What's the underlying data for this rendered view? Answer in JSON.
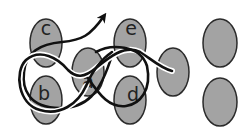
{
  "diagram": {
    "node_fill": "#a3a3a3",
    "node_stroke": "#2b2b2b",
    "path_color": "#111111",
    "nodes": [
      {
        "id": "c",
        "label": "c",
        "cx": 46,
        "cy": 43
      },
      {
        "id": "b",
        "label": "b",
        "cx": 46,
        "cy": 100
      },
      {
        "id": "a",
        "label": "a",
        "cx": 88,
        "cy": 72
      },
      {
        "id": "e",
        "label": "e",
        "cx": 130,
        "cy": 43
      },
      {
        "id": "d",
        "label": "d",
        "cx": 130,
        "cy": 100
      },
      {
        "id": "n6",
        "label": "",
        "cx": 173,
        "cy": 72
      },
      {
        "id": "n7",
        "label": "",
        "cx": 220,
        "cy": 43
      },
      {
        "id": "n8",
        "label": "",
        "cx": 220,
        "cy": 102
      }
    ],
    "paths": [
      {
        "name": "outer-loop-path",
        "description": "path through c, b, a, e, d ending near unlabeled node"
      },
      {
        "name": "arrow-path",
        "description": "path exiting past c with arrowhead pointing up-right"
      }
    ]
  }
}
